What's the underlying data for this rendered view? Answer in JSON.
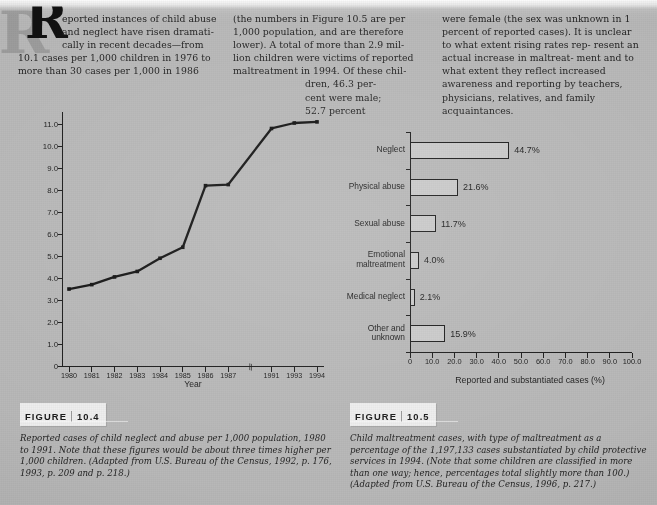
{
  "page": {
    "background_color": "#b9b9b9",
    "ink_color": "#1d1d1d"
  },
  "dropcap": {
    "letter": "R"
  },
  "body_text": {
    "column1": [
      "eported instances of child abuse",
      "and neglect have risen dramati-",
      "cally in recent decades—from",
      "10.1 cases per 1,000 children in 1976 to",
      "more than 30 cases per 1,000 in 1986"
    ],
    "column2": [
      "(the numbers in Figure 10.5 are per",
      "1,000 population, and are therefore",
      "lower). A total of more than 2.9 mil-",
      "lion children were victims of reported",
      "maltreatment in 1994. Of these chil-",
      "dren, 46.3 per-",
      "cent were male;",
      "52.7 percent"
    ],
    "column3": [
      "were female (the sex was unknown",
      "in 1 percent of reported cases). It is",
      "unclear to what extent rising rates rep-",
      "resent an actual increase in maltreat-",
      "ment and to what extent they reflect",
      "increased awareness and reporting by",
      "teachers, physicians, relatives, and",
      "family acquaintances."
    ]
  },
  "figures": [
    {
      "tag_word": "FIGURE",
      "number": "10.4",
      "caption": "Reported cases of child neglect and abuse per 1,000 population, 1980 to 1991. Note that these figures would be about three times higher per 1,000 children. (Adapted from U.S. Bureau of the Census, 1992, p. 176, 1993, p. 209 and p. 218.)"
    },
    {
      "tag_word": "FIGURE",
      "number": "10.5",
      "caption": "Child maltreatment cases, with type of maltreatment as a percentage of the 1,197,133 cases substantiated by child protective services in 1994. (Note that some children are classified in more than one way; hence, percentages total slightly more than 100.) (Adapted from U.S. Bureau of the Census, 1996, p. 217.)"
    }
  ],
  "chart_data": [
    {
      "type": "line",
      "title": "",
      "xlabel": "Year",
      "ylabel": "Reports per 1,000 population",
      "categories": [
        "1980",
        "1981",
        "1982",
        "1983",
        "1984",
        "1985",
        "1986",
        "1987",
        "1991",
        "1993",
        "1994"
      ],
      "values": [
        3.5,
        3.7,
        4.05,
        4.3,
        4.9,
        5.4,
        8.2,
        8.25,
        10.8,
        11.05,
        11.1
      ],
      "yticks": [
        "0",
        "1.0",
        "2.0",
        "3.0",
        "4.0",
        "5.0",
        "6.0",
        "7.0",
        "8.0",
        "9.0",
        "10.0",
        "11.0"
      ],
      "ylim": [
        0,
        11.55
      ],
      "grid": false,
      "axis_break_after": "1987",
      "axis_break_glyph": "\\\\",
      "legend": "none",
      "marker": "filled-square"
    },
    {
      "type": "bar",
      "orientation": "horizontal",
      "title": "",
      "xlabel": "Reported and substantiated cases (%)",
      "ylabel": "",
      "categories": [
        "Neglect",
        "Physical abuse",
        "Sexual abuse",
        "Emotional maltreatment",
        "Medical neglect",
        "Other and unknown"
      ],
      "values": [
        44.7,
        21.6,
        11.7,
        4.0,
        2.1,
        15.9
      ],
      "value_labels": [
        "44.7%",
        "21.6%",
        "11.7%",
        "4.0%",
        "2.1%",
        "15.9%"
      ],
      "xticks": [
        "0",
        "10.0",
        "20.0",
        "30.0",
        "40.0",
        "50.0",
        "60.0",
        "70.0",
        "80.0",
        "90.0",
        "100.0"
      ],
      "xlim": [
        0,
        100
      ],
      "grid": false,
      "legend": "none",
      "bar_fill": "#cbcbcb",
      "bar_stroke": "#1d1d1d"
    }
  ]
}
